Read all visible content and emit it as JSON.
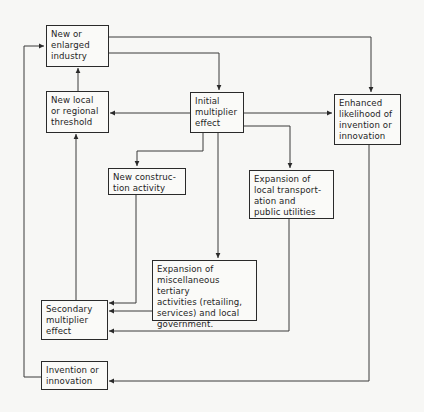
{
  "diagram": {
    "nodes": [
      {
        "id": "new_industry",
        "label": "New or\nenlarged\nindustry"
      },
      {
        "id": "threshold",
        "label": "New local\nor regional\nthreshold"
      },
      {
        "id": "initial_multiplier",
        "label": "Initial\nmultiplier\neffect"
      },
      {
        "id": "enhanced_likelihood",
        "label": "Enhanced\nlikelihood of\ninvention or\ninnovation"
      },
      {
        "id": "construction",
        "label": "New construc-\ntion activity"
      },
      {
        "id": "transport",
        "label": "Expansion of\nlocal transport-\nation and\npublic utilities"
      },
      {
        "id": "tertiary",
        "label": "Expansion of\nmiscellaneous tertiary\nactivities (retailing,\nservices) and local\ngovernment."
      },
      {
        "id": "secondary_multiplier",
        "label": "Secondary\nmultiplier\neffect"
      },
      {
        "id": "invention",
        "label": "Invention or\ninnovation"
      }
    ],
    "edges": [
      {
        "from": "new_industry",
        "to": "initial_multiplier"
      },
      {
        "from": "new_industry",
        "to": "enhanced_likelihood"
      },
      {
        "from": "threshold",
        "to": "new_industry"
      },
      {
        "from": "initial_multiplier",
        "to": "threshold"
      },
      {
        "from": "initial_multiplier",
        "to": "enhanced_likelihood"
      },
      {
        "from": "initial_multiplier",
        "to": "construction"
      },
      {
        "from": "initial_multiplier",
        "to": "transport"
      },
      {
        "from": "initial_multiplier",
        "to": "tertiary"
      },
      {
        "from": "construction",
        "to": "secondary_multiplier"
      },
      {
        "from": "tertiary",
        "to": "secondary_multiplier"
      },
      {
        "from": "transport",
        "to": "secondary_multiplier"
      },
      {
        "from": "secondary_multiplier",
        "to": "threshold"
      },
      {
        "from": "enhanced_likelihood",
        "to": "invention"
      },
      {
        "from": "invention",
        "to": "new_industry"
      }
    ]
  }
}
